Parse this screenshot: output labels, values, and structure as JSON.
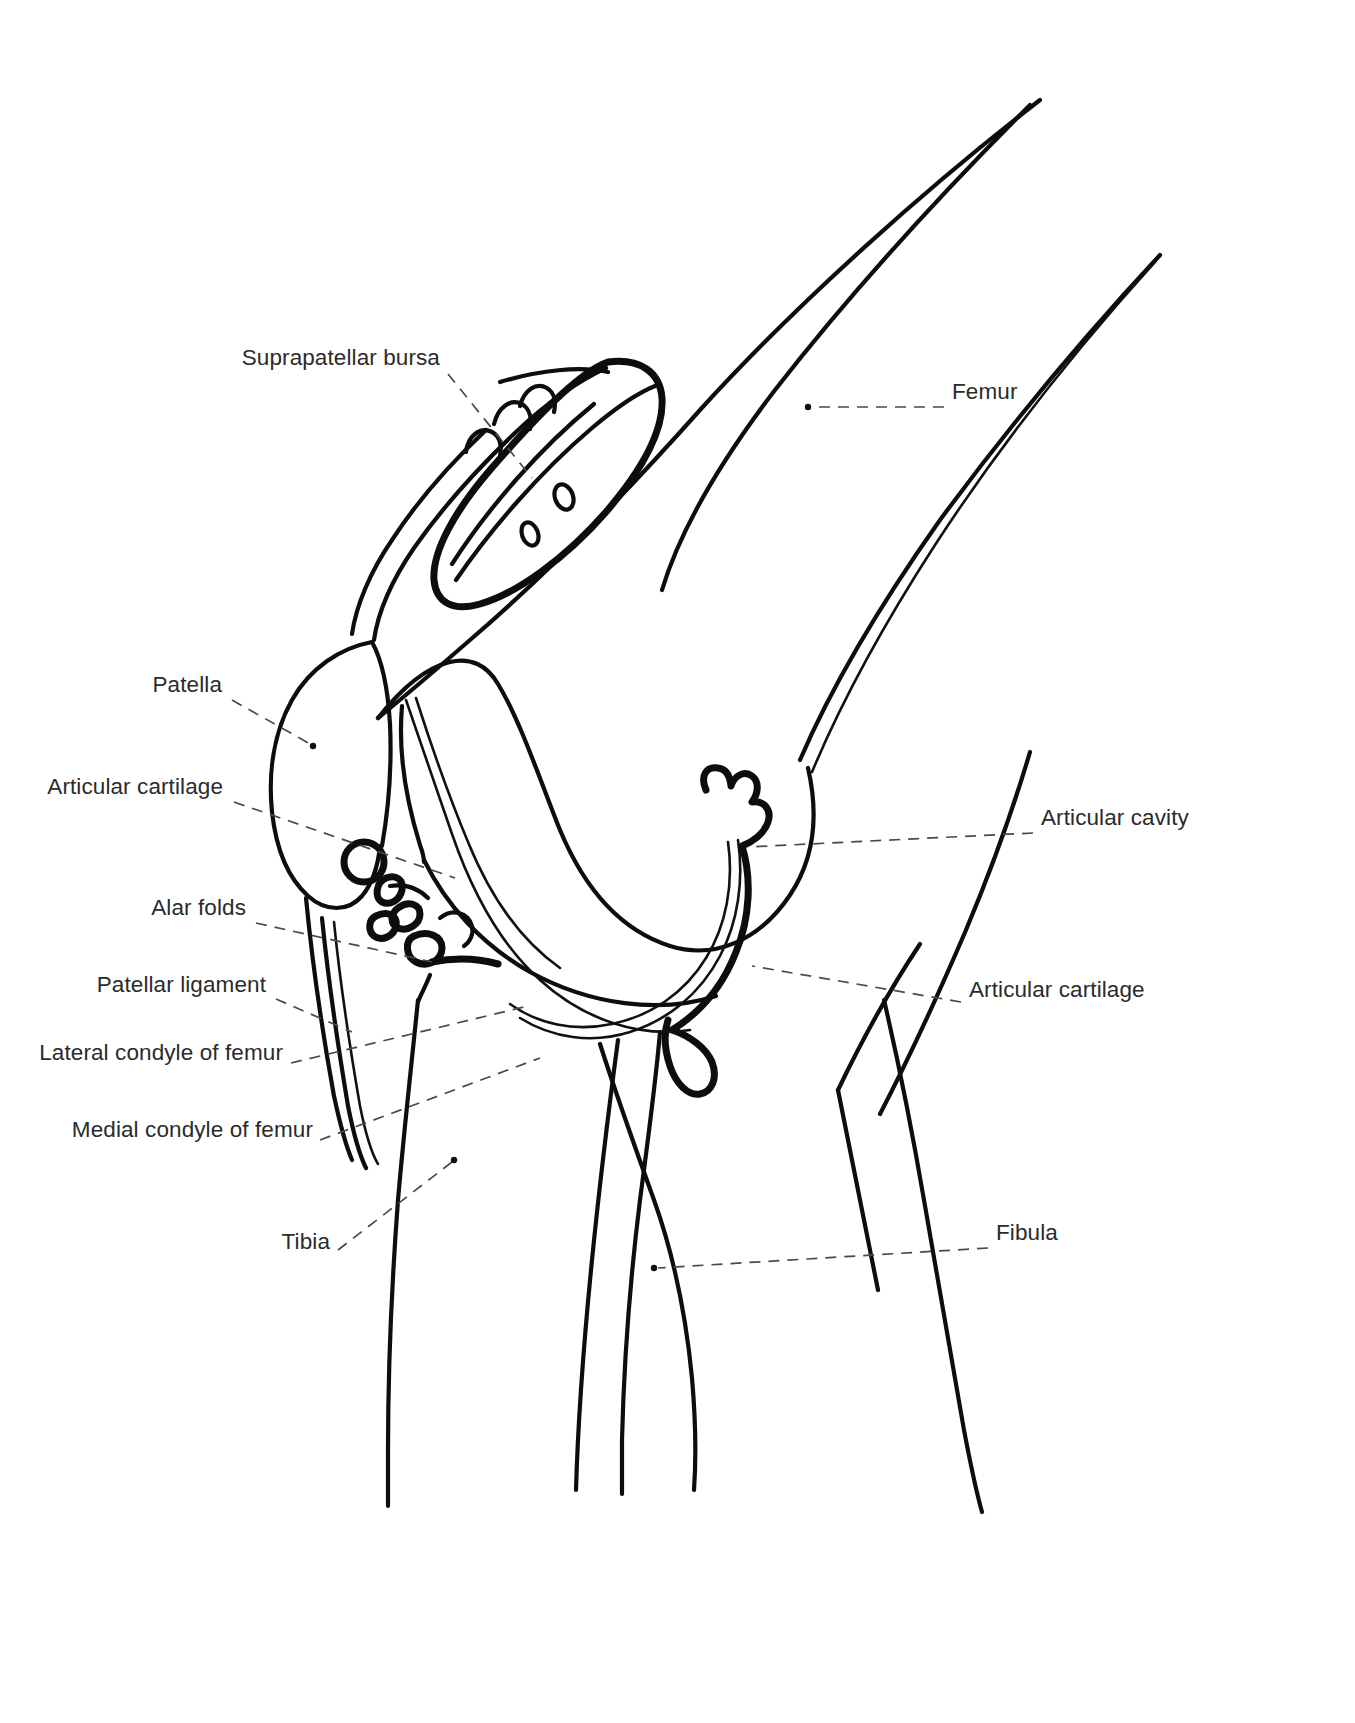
{
  "figure": {
    "background_color": "#ffffff",
    "ink_color": "#0d0d0d",
    "leader_color": "#4a4a4a",
    "width": 1355,
    "height": 1723
  },
  "labels": [
    {
      "id": "suprapatellar-bursa",
      "text": "Suprapatellar bursa",
      "side": "left",
      "text_x": 440,
      "text_y": 358,
      "leader_from": [
        448,
        374
      ],
      "leader_to": [
        532,
        478
      ],
      "endpoint_marker": "none"
    },
    {
      "id": "patella",
      "text": "Patella",
      "side": "left",
      "text_x": 222,
      "text_y": 685,
      "leader_from": [
        232,
        700
      ],
      "leader_to": [
        342,
        747
      ],
      "endpoint_marker": "dot"
    },
    {
      "id": "articular-cartilage-patella",
      "text": "Articular cartilage",
      "side": "left",
      "text_x": 223,
      "text_y": 787,
      "leader_from": [
        234,
        802
      ],
      "leader_to": [
        455,
        878
      ],
      "endpoint_marker": "none"
    },
    {
      "id": "alar-folds",
      "text": "Alar folds",
      "side": "left",
      "text_x": 246,
      "text_y": 908,
      "leader_from": [
        256,
        923
      ],
      "leader_to": [
        432,
        962
      ],
      "endpoint_marker": "none"
    },
    {
      "id": "patellar-ligament",
      "text": "Patellar ligament",
      "side": "left",
      "text_x": 266,
      "text_y": 985,
      "leader_from": [
        276,
        999
      ],
      "leader_to": [
        352,
        1032
      ],
      "endpoint_marker": "none"
    },
    {
      "id": "lateral-condyle-of-femur",
      "text": "Lateral condyle of femur",
      "side": "left",
      "text_x": 283,
      "text_y": 1053,
      "leader_from": [
        291,
        1068
      ],
      "leader_to": [
        528,
        1006
      ],
      "endpoint_marker": "none"
    },
    {
      "id": "medial-condyle-of-femur",
      "text": "Medial condyle of femur",
      "side": "left",
      "text_x": 313,
      "text_y": 1130,
      "leader_from": [
        320,
        1145
      ],
      "leader_to": [
        540,
        1060
      ],
      "endpoint_marker": "none"
    },
    {
      "id": "tibia",
      "text": "Tibia",
      "side": "left",
      "text_x": 330,
      "text_y": 1242,
      "leader_from": [
        340,
        1256
      ],
      "leader_to": [
        455,
        1160
      ],
      "endpoint_marker": "dot"
    },
    {
      "id": "femur",
      "text": "Femur",
      "side": "right",
      "text_x": 952,
      "text_y": 392,
      "leader_from": [
        944,
        407
      ],
      "leader_to": [
        806,
        407
      ],
      "endpoint_marker": "dot"
    },
    {
      "id": "articular-cavity",
      "text": "Articular cavity",
      "side": "right",
      "text_x": 1041,
      "text_y": 818,
      "leader_from": [
        1033,
        833
      ],
      "leader_to": [
        748,
        847
      ],
      "endpoint_marker": "none"
    },
    {
      "id": "articular-cartilage-tibia",
      "text": "Articular cartilage",
      "side": "right",
      "text_x": 969,
      "text_y": 990,
      "leader_from": [
        961,
        1005
      ],
      "leader_to": [
        752,
        966
      ],
      "endpoint_marker": "none"
    },
    {
      "id": "fibula",
      "text": "Fibula",
      "side": "right",
      "text_x": 996,
      "text_y": 1233,
      "leader_from": [
        988,
        1248
      ],
      "leader_to": [
        655,
        1268
      ],
      "endpoint_marker": "dot"
    }
  ],
  "structures": [
    {
      "id": "femur-shaft",
      "name": "Femur shaft"
    },
    {
      "id": "femoral-condyle",
      "name": "Femoral condyle"
    },
    {
      "id": "patella-bone",
      "name": "Patella"
    },
    {
      "id": "quadriceps-tendon",
      "name": "Quadriceps tendon"
    },
    {
      "id": "suprapatellar-bursa-shape",
      "name": "Suprapatellar bursa"
    },
    {
      "id": "articular-cavity-outline",
      "name": "Articular cavity"
    },
    {
      "id": "tibia-shaft",
      "name": "Tibia"
    },
    {
      "id": "fibula-shaft",
      "name": "Fibula"
    },
    {
      "id": "patellar-ligament-strands",
      "name": "Patellar ligament"
    },
    {
      "id": "alar-fold-shapes",
      "name": "Alar folds"
    }
  ]
}
